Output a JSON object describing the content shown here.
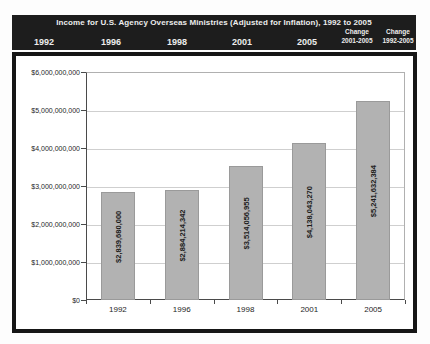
{
  "header": {
    "title": "Income for U.S. Agency Overseas Ministries (Adjusted for Inflation), 1992 to 2005",
    "columns": [
      "1992",
      "1996",
      "1998",
      "2001",
      "2005"
    ],
    "change_columns": [
      {
        "line1": "Change",
        "line2": "2001-2005"
      },
      {
        "line1": "Change",
        "line2": "1992-2005"
      }
    ]
  },
  "chart_data": {
    "type": "bar",
    "categories": [
      "1992",
      "1996",
      "1998",
      "2001",
      "2005"
    ],
    "values": [
      2839680000,
      2884214342,
      3514056955,
      4138043270,
      5241632384
    ],
    "bar_labels": [
      "$2,839,680,000",
      "$2,884,214,342",
      "$3,514,056,955",
      "$4,138,043,270",
      "$5,241,632,384"
    ],
    "title": "Income for U.S. Agency Overseas Ministries (Adjusted for Inflation), 1992 to 2005",
    "xlabel": "",
    "ylabel": "",
    "ylim": [
      0,
      6000000000
    ],
    "ytick_step": 1000000000,
    "ytick_labels": [
      "$0",
      "$1,000,000,000",
      "$2,000,000,000",
      "$3,000,000,000",
      "$4,000,000,000",
      "$5,000,000,000",
      "$6,000,000,000"
    ],
    "grid": true,
    "legend": "none",
    "bar_label_orientation": "vertical"
  },
  "colors": {
    "header_bg": "#1d1d1d",
    "header_text": "#ededed",
    "chart_frame": "#161616",
    "bar_fill": "#b2b2b2",
    "bar_border": "#9a9a9a",
    "grid_line": "#cfcfcf",
    "axis_line": "#4a4a4a",
    "tick_text": "#1e1e1e"
  }
}
